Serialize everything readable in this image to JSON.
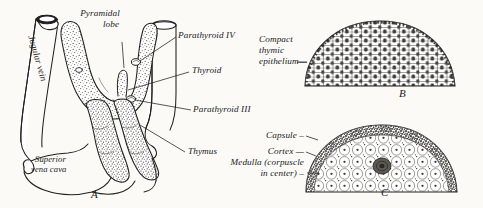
{
  "plate": {
    "background_color": "#fbfaf7",
    "ink_color": "#20201d",
    "stipple_color": "#6e6b63"
  },
  "panel_a": {
    "figure_letter": "A",
    "labels": {
      "jugular_vein": "Jugular vein",
      "pyramidal_lobe_line1": "Pyramidal",
      "pyramidal_lobe_line2": "lobe",
      "parathyroid_iv": "Parathyroid IV",
      "thyroid": "Thyroid",
      "parathyroid_iii": "Parathyroid III",
      "thymus": "Thymus",
      "superior_vena_cava_line1": "Superior",
      "superior_vena_cava_line2": "vena cava"
    }
  },
  "panel_b": {
    "figure_letter": "B",
    "labels": {
      "compact_line1": "Compact",
      "compact_line2": "thymic",
      "compact_line3": "epithelium—"
    }
  },
  "panel_c": {
    "figure_letter": "C",
    "labels": {
      "capsule": "Capsule –",
      "cortex": "Cortex —",
      "medulla_line1": "Medulla (corpuscle",
      "medulla_line2": "in center) –"
    }
  }
}
